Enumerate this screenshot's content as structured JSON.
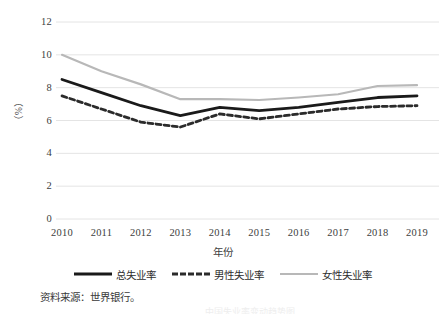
{
  "chart_data": {
    "type": "line",
    "title": "",
    "xlabel": "年份",
    "ylabel": "（%）",
    "categories": [
      "2010",
      "2011",
      "2012",
      "2013",
      "2014",
      "2015",
      "2016",
      "2017",
      "2018",
      "2019"
    ],
    "xtick_labels": [
      "2010",
      "2011",
      "2012",
      "2013",
      "2014",
      "2015",
      "2016",
      "2017",
      "2018",
      "2019"
    ],
    "ytick_labels": [
      "12",
      "10",
      "8",
      "6",
      "4",
      "2",
      "0"
    ],
    "ylim": [
      0,
      12
    ],
    "ytick_values": [
      12,
      10,
      8,
      6,
      4,
      2,
      0
    ],
    "grid": "horizontal",
    "legend_position": "bottom",
    "series": [
      {
        "name": "总失业率",
        "style": "solid",
        "color": "#1a1a1a",
        "values": [
          8.5,
          7.7,
          6.9,
          6.3,
          6.8,
          6.6,
          6.8,
          7.1,
          7.4,
          7.5
        ]
      },
      {
        "name": "男性失业率",
        "style": "dashed",
        "color": "#2b2b2b",
        "values": [
          7.5,
          6.7,
          5.9,
          5.6,
          6.4,
          6.1,
          6.4,
          6.7,
          6.85,
          6.9
        ]
      },
      {
        "name": "女性失业率",
        "style": "solid",
        "color": "#b8b8b8",
        "values": [
          10.0,
          9.0,
          8.2,
          7.3,
          7.3,
          7.25,
          7.4,
          7.6,
          8.1,
          8.15
        ]
      }
    ]
  },
  "legend": {
    "items": [
      {
        "label": "总失业率"
      },
      {
        "label": "男性失业率"
      },
      {
        "label": "女性失业率"
      }
    ]
  },
  "notes": {
    "source": "资料来源：世界银行。",
    "caption_cut": "中国失业率变动趋势图"
  },
  "colors": {
    "total": "#1a1a1a",
    "male": "#2b2b2b",
    "female": "#b8b8b8",
    "grid": "#e4e4e4",
    "text": "#404040"
  }
}
